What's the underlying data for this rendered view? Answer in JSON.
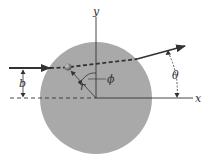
{
  "diagram": {
    "labels": {
      "y_axis": "y",
      "x_axis": "x",
      "impact_parameter": "b",
      "radius": "r",
      "azimuth": "ϕ",
      "scattering_angle": "θ"
    },
    "colors": {
      "sphere": "#a9a9a9",
      "lines": "#333333",
      "particle": "#6f6f6f",
      "background": "#ffffff"
    }
  }
}
